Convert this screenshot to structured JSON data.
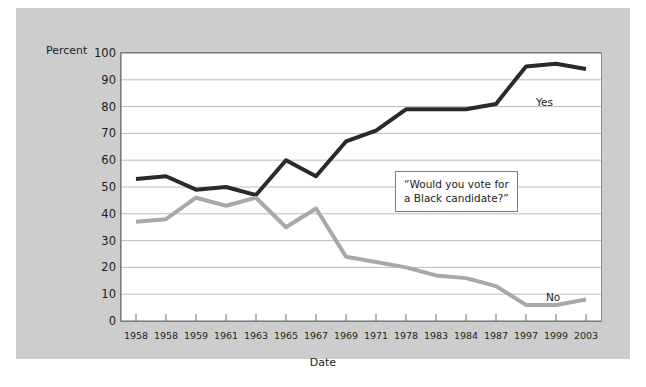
{
  "chart_data": {
    "type": "line",
    "title": "",
    "xlabel": "Date",
    "ylabel": "Percent",
    "ylim": [
      0,
      100
    ],
    "ytick_step": 10,
    "grid": true,
    "legend_position": "inline-right",
    "categories": [
      "1958",
      "1958",
      "1959",
      "1961",
      "1963",
      "1965",
      "1967",
      "1969",
      "1971",
      "1978",
      "1983",
      "1984",
      "1987",
      "1997",
      "1999",
      "2003"
    ],
    "yticks": [
      0,
      10,
      20,
      30,
      40,
      50,
      60,
      70,
      80,
      90,
      100
    ],
    "series": [
      {
        "name": "Yes",
        "color": "#2a2a2a",
        "values": [
          53,
          54,
          49,
          50,
          47,
          60,
          54,
          67,
          71,
          79,
          79,
          79,
          81,
          95,
          96,
          94
        ]
      },
      {
        "name": "No",
        "color": "#a8a8a8",
        "values": [
          37,
          38,
          46,
          43,
          46,
          35,
          42,
          24,
          22,
          20,
          17,
          16,
          13,
          6,
          6,
          8
        ]
      }
    ],
    "annotations": [
      {
        "name": "question-callout",
        "text": "“Would you vote for\na Black candidate?”"
      }
    ]
  },
  "colors": {
    "figure_background": "#cdcdcd",
    "plot_background": "#ffffff",
    "grid": "#b4b4b4",
    "axis": "#6d6d6d",
    "text": "#1d1d1d"
  }
}
